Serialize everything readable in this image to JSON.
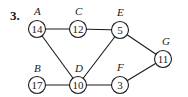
{
  "problem_number": "3.",
  "nodes": {
    "A": {
      "label": "A",
      "value": "14"
    },
    "B": {
      "label": "B",
      "value": "17"
    },
    "C": {
      "label": "C",
      "value": "12"
    },
    "D": {
      "label": "D",
      "value": "10"
    },
    "E": {
      "label": "E",
      "value": "5"
    },
    "F": {
      "label": "F",
      "value": "3"
    },
    "G": {
      "label": "G",
      "value": "11"
    }
  },
  "edges": [
    [
      "A",
      "C"
    ],
    [
      "C",
      "E"
    ],
    [
      "A",
      "D"
    ],
    [
      "B",
      "D"
    ],
    [
      "D",
      "E"
    ],
    [
      "D",
      "F"
    ],
    [
      "E",
      "G"
    ],
    [
      "F",
      "G"
    ]
  ]
}
